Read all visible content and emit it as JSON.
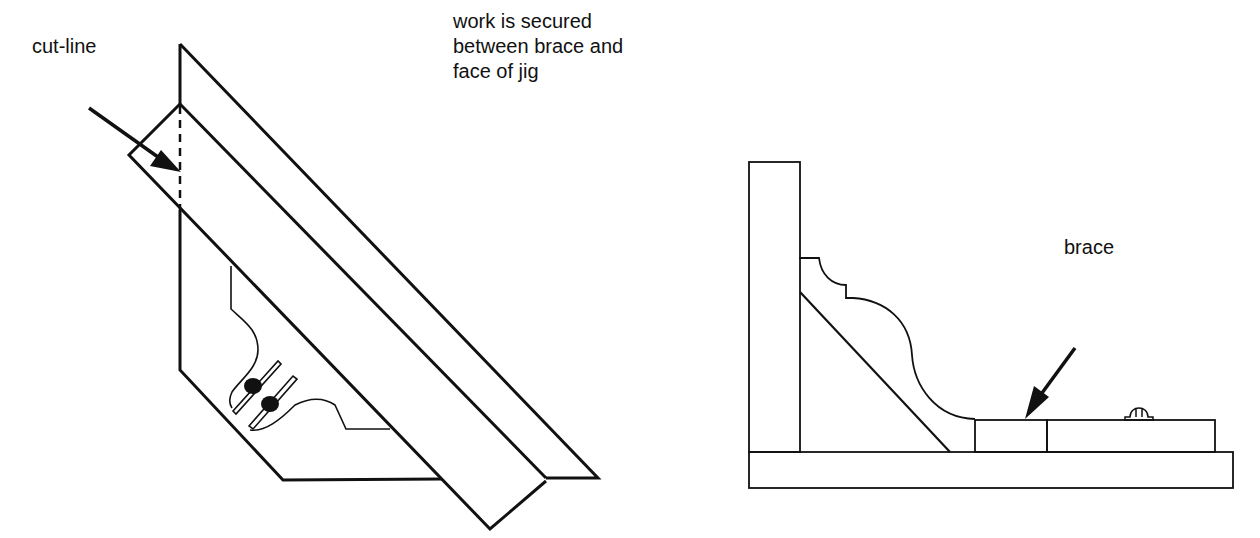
{
  "figure": {
    "left_view": {
      "callout": "cut-line",
      "note": "work is secured\nbetween brace and\nface of jig"
    },
    "right_view": {
      "callout": "brace"
    },
    "colors": {
      "line": "#111111",
      "background": "#ffffff"
    }
  }
}
